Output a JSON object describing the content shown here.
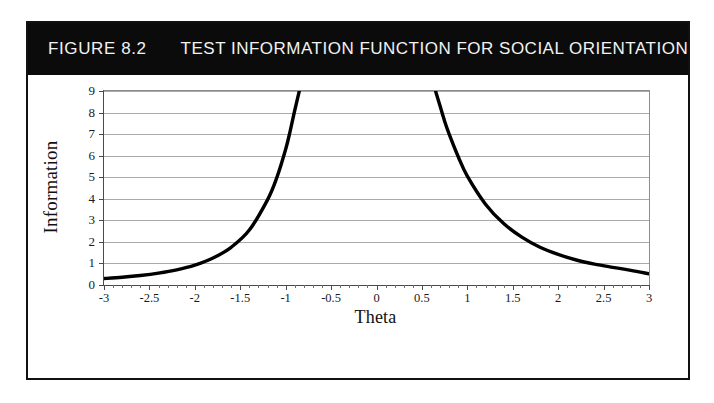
{
  "figure": {
    "number": "FIGURE 8.2",
    "title": "TEST INFORMATION FUNCTION FOR SOCIAL ORIENTATION USUAL SCALE",
    "header_background": "#0b0b0b",
    "header_text_color": "#f2f2f2",
    "border_color": "#111111",
    "background": "#ffffff"
  },
  "chart_data": {
    "type": "line",
    "title": "TEST INFORMATION FUNCTION FOR SOCIAL ORIENTATION USUAL SCALE",
    "xlabel": "Theta",
    "ylabel": "Information",
    "xlim": [
      -3,
      3
    ],
    "ylim": [
      0,
      9
    ],
    "grid": true,
    "legend": "none",
    "line_color": "#000000",
    "grid_color": "#a9a9a9",
    "axis_color": "#4a4a4a",
    "xticks": [
      -3,
      -2.5,
      -2,
      -1.5,
      -1,
      -0.5,
      0,
      0.5,
      1,
      1.5,
      2,
      2.5,
      3
    ],
    "xtick_labels": [
      "-3",
      "-2.5",
      "-2",
      "-1.5",
      "-1",
      "-0.5",
      "0",
      "0.5",
      "1",
      "1.5",
      "2",
      "2.5",
      "3"
    ],
    "yticks": [
      0,
      1,
      2,
      3,
      4,
      5,
      6,
      7,
      8,
      9
    ],
    "ytick_labels": [
      "0",
      "1",
      "2",
      "3",
      "4",
      "5",
      "6",
      "7",
      "8",
      "9"
    ],
    "note": "Two-branch U-shaped information curve; both branches rise off the top of the plot (values exceed 9) between theta = -0.85 and theta = 0.65, so the curve is clipped at the y-axis maximum.",
    "series": [
      {
        "name": "left-branch",
        "x": [
          -3.0,
          -2.8,
          -2.6,
          -2.4,
          -2.2,
          -2.0,
          -1.8,
          -1.6,
          -1.4,
          -1.2,
          -1.1,
          -1.0,
          -0.95,
          -0.9,
          -0.85
        ],
        "y": [
          0.3,
          0.36,
          0.44,
          0.55,
          0.7,
          0.92,
          1.25,
          1.75,
          2.55,
          3.95,
          4.95,
          6.3,
          7.15,
          8.1,
          9.0
        ]
      },
      {
        "name": "right-branch",
        "x": [
          0.65,
          0.7,
          0.75,
          0.8,
          0.9,
          1.0,
          1.2,
          1.4,
          1.6,
          1.8,
          2.0,
          2.2,
          2.4,
          2.6,
          2.8,
          3.0
        ],
        "y": [
          9.0,
          8.3,
          7.6,
          7.0,
          5.95,
          5.05,
          3.75,
          2.85,
          2.22,
          1.75,
          1.42,
          1.16,
          0.97,
          0.82,
          0.68,
          0.52
        ]
      }
    ]
  }
}
